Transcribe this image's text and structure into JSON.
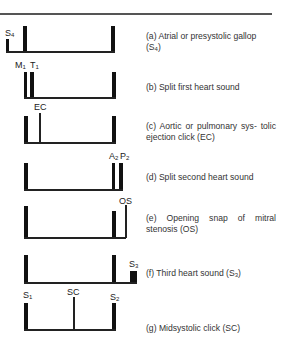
{
  "figure": {
    "rows": [
      {
        "id": "a",
        "description": "(a) Atrial or presystolic gallop",
        "description_line2_pre": "(S",
        "description_line2_sub": "4",
        "description_line2_post": ")",
        "labels": [
          {
            "main": "S",
            "sub": "4"
          }
        ]
      },
      {
        "id": "b",
        "description": "(b) Split first heart sound",
        "labels": [
          {
            "main": "M",
            "sub": "1"
          },
          {
            "main": "T",
            "sub": "1"
          }
        ]
      },
      {
        "id": "c",
        "description": "(c) Aortic or pulmonary sys- tolic ejection click (EC)",
        "labels": [
          {
            "main": "EC"
          }
        ]
      },
      {
        "id": "d",
        "description": "(d) Split second heart sound",
        "labels": [
          {
            "main": "A",
            "sub": "2"
          },
          {
            "main": "P",
            "sub": "2"
          }
        ]
      },
      {
        "id": "e",
        "description": "(e) Opening snap of mitral stenosis (OS)",
        "labels": [
          {
            "main": "OS"
          }
        ]
      },
      {
        "id": "f",
        "description_pre": "(f) Third heart sound (S",
        "description_sub": "3",
        "description_post": ")",
        "labels": [
          {
            "main": "S",
            "sub": "3"
          }
        ]
      },
      {
        "id": "g",
        "description": "(g) Midsystolic click (SC)",
        "labels": [
          {
            "main": "S",
            "sub": "1"
          },
          {
            "main": "SC"
          },
          {
            "main": "S",
            "sub": "2"
          }
        ]
      }
    ]
  }
}
